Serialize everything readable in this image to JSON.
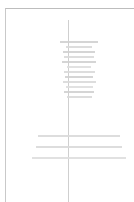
{
  "document": {
    "view": "page-preview",
    "zoom_level": "fit-page",
    "page_background": "#ffffff",
    "page_border_color": "#c9c9c9",
    "text_color": "#d4d4d4",
    "guide_line_color": "#cfcfcf",
    "guide_line_label": "center-margin-guide"
  },
  "content": {
    "title_block": {
      "name": "centered-heading-block",
      "alignment": "center",
      "line_count": 12,
      "lines": [
        {
          "width_px": 38,
          "tone": "tone-a"
        },
        {
          "width_px": 26,
          "tone": "tone-b"
        },
        {
          "width_px": 32,
          "tone": "tone-a"
        },
        {
          "width_px": 30,
          "tone": "tone-b"
        },
        {
          "width_px": 34,
          "tone": "tone-a"
        },
        {
          "width_px": 24,
          "tone": "tone-c"
        },
        {
          "width_px": 31,
          "tone": "tone-b"
        },
        {
          "width_px": 28,
          "tone": "tone-a"
        },
        {
          "width_px": 33,
          "tone": "tone-b"
        },
        {
          "width_px": 27,
          "tone": "tone-c"
        },
        {
          "width_px": 30,
          "tone": "tone-a"
        },
        {
          "width_px": 25,
          "tone": "tone-b"
        }
      ]
    },
    "body_block": {
      "name": "centered-paragraph-block",
      "alignment": "center",
      "line_count": 3,
      "lines": [
        {
          "width_px": 82,
          "tone": "tone-b"
        },
        {
          "width_px": 86,
          "tone": "tone-b"
        },
        {
          "width_px": 94,
          "tone": "tone-c"
        }
      ]
    }
  }
}
